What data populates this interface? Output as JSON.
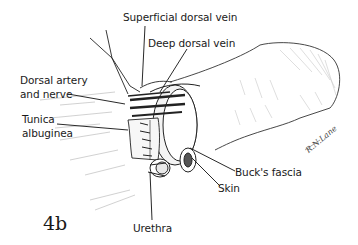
{
  "figure": {
    "number": "4b",
    "signature": "R.N.Lane"
  },
  "labels": {
    "superficial_dorsal_vein": "Superficial dorsal vein",
    "deep_dorsal_vein": "Deep dorsal vein",
    "dorsal_artery_line1": "Dorsal artery",
    "dorsal_artery_line2": "and nerve",
    "tunica_line1": "Tunica",
    "tunica_line2": "albuginea",
    "bucks_fascia": "Buck's fascia",
    "skin": "Skin",
    "urethra": "Urethra"
  },
  "colors": {
    "ink": "#1a1a1a",
    "shade": "#9a9a9a",
    "background": "#ffffff"
  }
}
